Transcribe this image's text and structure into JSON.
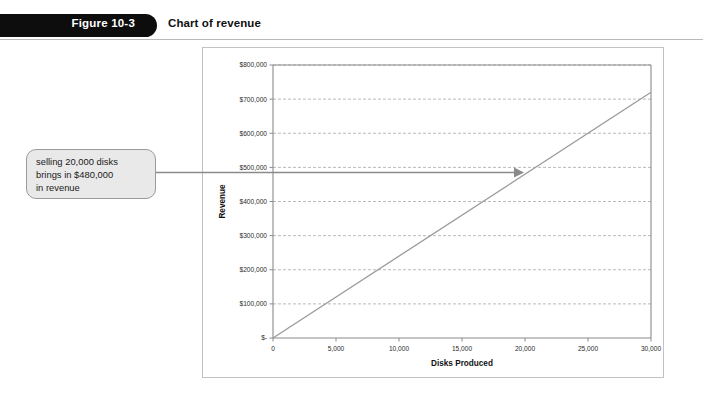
{
  "figure": {
    "number": "Figure 10-3",
    "caption": "Chart of revenue"
  },
  "callout": {
    "text": "selling 20,000 disks\nbrings in $480,000\nin revenue",
    "arrow_icon": "arrow-right-icon",
    "target_x_value": 20000,
    "target_y_value": 480000
  },
  "colors": {
    "banner": "#0d0d0d",
    "banner_text": "#ffffff",
    "caption_text": "#111111",
    "rule": "#b9b9b9",
    "chart_border": "#c2c2c2",
    "plot_border": "#8a8a8a",
    "gridline": "#a8a8a8",
    "series_line": "#9a9a9a",
    "callout_fill": "#e9e9e9",
    "callout_border": "#9a9a9a",
    "connector": "#8a8a8a"
  },
  "chart_data": {
    "type": "line",
    "title": "",
    "xlabel": "Disks Produced",
    "ylabel": "Revenue",
    "xlim": [
      0,
      30000
    ],
    "ylim": [
      0,
      800000
    ],
    "grid": true,
    "legend": false,
    "xticks": [
      0,
      5000,
      10000,
      15000,
      20000,
      25000,
      30000
    ],
    "xticklabels": [
      "0",
      "5,000",
      "10,000",
      "15,000",
      "20,000",
      "25,000",
      "30,000"
    ],
    "yticks": [
      0,
      100000,
      200000,
      300000,
      400000,
      500000,
      600000,
      700000,
      800000
    ],
    "yticklabels": [
      "$-",
      "$100,000",
      "$200,000",
      "$300,000",
      "$400,000",
      "$500,000",
      "$600,000",
      "$700,000",
      "$800,000"
    ],
    "series": [
      {
        "name": "Revenue",
        "x": [
          0,
          30000
        ],
        "values": [
          0,
          720000
        ],
        "slope_per_unit": 24
      }
    ]
  }
}
